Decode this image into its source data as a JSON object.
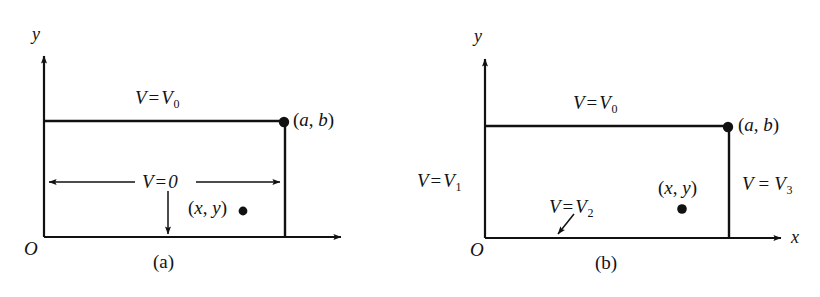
{
  "figure": {
    "type": "line-diagram",
    "stroke_color": "#111111",
    "background_color": "#ffffff",
    "panels": [
      {
        "id": "a",
        "caption": "(a)",
        "origin_label": "O",
        "axes": {
          "y_label": "y",
          "x_label": ""
        },
        "corner_point": {
          "label_open": "(",
          "label_x": "a",
          "label_comma": ", ",
          "label_y": "b",
          "label_close": ")",
          "full": "(a, b)"
        },
        "interior_point": {
          "label_open": "(",
          "label_x": "x",
          "label_comma": ", ",
          "label_y": "y",
          "label_close": ")",
          "full": "(x, y)"
        },
        "boundary_labels": [
          {
            "name": "top",
            "V": "V",
            "eq": "=",
            "value": "V",
            "sub": "0",
            "full": "V = V0"
          },
          {
            "name": "other-three-sides",
            "V": "V",
            "eq": "=",
            "value": "0",
            "sub": "",
            "full": "V = 0"
          }
        ]
      },
      {
        "id": "b",
        "caption": "(b)",
        "origin_label": "O",
        "axes": {
          "y_label": "y",
          "x_label": "x"
        },
        "corner_point": {
          "label_open": "(",
          "label_x": "a",
          "label_comma": ", ",
          "label_y": "b",
          "label_close": ")",
          "full": "(a, b)"
        },
        "interior_point": {
          "label_open": "(",
          "label_x": "x",
          "label_comma": ", ",
          "label_y": "y",
          "label_close": ")",
          "full": "(x, y)"
        },
        "boundary_labels": [
          {
            "name": "top",
            "V": "V",
            "eq": "=",
            "value": "V",
            "sub": "0",
            "full": "V = V0"
          },
          {
            "name": "left",
            "V": "V",
            "eq": "=",
            "value": "V",
            "sub": "1",
            "full": "V = V1"
          },
          {
            "name": "bottom",
            "V": "V",
            "eq": "=",
            "value": "V",
            "sub": "2",
            "full": "V = V2"
          },
          {
            "name": "right",
            "V": "V",
            "eq": "=",
            "value": "V",
            "sub": "3",
            "full": "V = V3"
          }
        ]
      }
    ]
  }
}
